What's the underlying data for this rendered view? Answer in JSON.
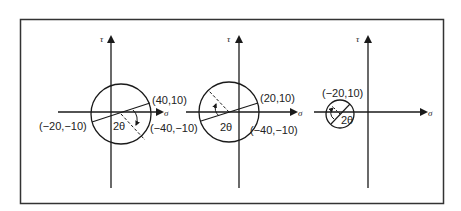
{
  "figure": {
    "frame_color": "#333333",
    "line_color": "#1a1a1a",
    "panels": [
      {
        "id": "panel-1",
        "tau_label": "τ",
        "sigma_label": "σ",
        "point_a": "(40,10)",
        "point_b": "(−20,−10)",
        "point_c": "(−40,−10)",
        "angle_label": "2θ"
      },
      {
        "id": "panel-2",
        "tau_label": "τ",
        "sigma_label": "σ",
        "point_a": "(20,10)",
        "point_b": "(−40,−10)",
        "angle_label": "2θ"
      },
      {
        "id": "panel-3",
        "tau_label": "τ",
        "sigma_label": "σ",
        "point_a": "(−20,10)",
        "point_b": "(−40,−10)",
        "angle_label": "2θ"
      }
    ]
  }
}
